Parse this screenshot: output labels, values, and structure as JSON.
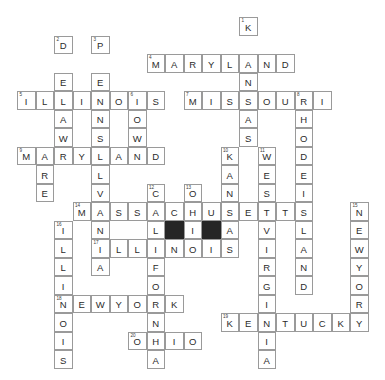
{
  "puzzle": {
    "kind": "crossword-grid",
    "columns": 21,
    "rows": 20,
    "cell_size": 18.5,
    "origin_x": 17,
    "origin_y": 17,
    "grid_color": "#9a9a9a",
    "block_color": "#262626",
    "letter_color": "#2b2b2b",
    "background": "#ffffff",
    "entries": [
      {
        "number": "1",
        "direction": "down",
        "answer": "KANSAS",
        "row": 0,
        "col": 12
      },
      {
        "number": "2",
        "direction": "down",
        "answer": "DELAWARE",
        "row": 1,
        "col": 2
      },
      {
        "number": "3",
        "direction": "down",
        "answer": "PENNSYLVANIA",
        "row": 1,
        "col": 4
      },
      {
        "number": "4",
        "direction": "across",
        "answer": "MARYLAND",
        "row": 2,
        "col": 7
      },
      {
        "number": "5",
        "direction": "across",
        "answer": "ILLINOIS",
        "row": 4,
        "col": 0
      },
      {
        "number": "6",
        "direction": "down",
        "answer": "IOWA",
        "row": 4,
        "col": 6
      },
      {
        "number": "7",
        "direction": "across",
        "answer": "MISSOURI",
        "row": 4,
        "col": 9
      },
      {
        "number": "8",
        "direction": "down",
        "answer": "RHODEISLAND",
        "row": 4,
        "col": 15
      },
      {
        "number": "9",
        "direction": "across",
        "answer": "MARYLAND",
        "row": 7,
        "col": 0
      },
      {
        "number": "10",
        "direction": "down",
        "answer": "KANSAS",
        "row": 7,
        "col": 11
      },
      {
        "number": "11",
        "direction": "down",
        "answer": "WESTVIRGINIA",
        "row": 7,
        "col": 13
      },
      {
        "number": "12",
        "direction": "down",
        "answer": "CALIFORNIA",
        "row": 9,
        "col": 7
      },
      {
        "number": "13",
        "direction": "down",
        "answer": "OHIO",
        "row": 9,
        "col": 9
      },
      {
        "number": "14",
        "direction": "across",
        "answer": "MASSACHUSETTS",
        "row": 10,
        "col": 3
      },
      {
        "number": "15",
        "direction": "down",
        "answer": "NEWYORK",
        "row": 10,
        "col": 18
      },
      {
        "number": "16",
        "direction": "down",
        "answer": "ILLINOIS",
        "row": 11,
        "col": 2
      },
      {
        "number": "17",
        "direction": "across",
        "answer": "ILLINOIS",
        "row": 12,
        "col": 4
      },
      {
        "number": "18",
        "direction": "across",
        "answer": "NEWYORK",
        "row": 15,
        "col": 2
      },
      {
        "number": "19",
        "direction": "across",
        "answer": "KENTUCKY",
        "row": 16,
        "col": 11
      },
      {
        "number": "20",
        "direction": "across",
        "answer": "OHIO",
        "row": 17,
        "col": 6
      }
    ],
    "extra_cells": [
      {
        "row": 2,
        "col": 3,
        "letter": ""
      },
      {
        "row": 11,
        "col": 7,
        "letter": "",
        "block": true
      },
      {
        "row": 11,
        "col": 9,
        "letter": "",
        "block": true
      }
    ],
    "letters": [
      {
        "row": 0,
        "col": 12,
        "letter": "K",
        "number": "1"
      },
      {
        "row": 1,
        "col": 2,
        "letter": "D",
        "number": "2"
      },
      {
        "row": 1,
        "col": 4,
        "letter": "P",
        "number": "3"
      },
      {
        "row": 2,
        "col": 7,
        "letter": "M",
        "number": "4"
      },
      {
        "row": 2,
        "col": 8,
        "letter": "A"
      },
      {
        "row": 2,
        "col": 9,
        "letter": "R"
      },
      {
        "row": 2,
        "col": 10,
        "letter": "Y"
      },
      {
        "row": 2,
        "col": 11,
        "letter": "L"
      },
      {
        "row": 2,
        "col": 12,
        "letter": "A"
      },
      {
        "row": 2,
        "col": 13,
        "letter": "N"
      },
      {
        "row": 2,
        "col": 14,
        "letter": "D"
      },
      {
        "row": 3,
        "col": 2,
        "letter": "E"
      },
      {
        "row": 3,
        "col": 4,
        "letter": "E"
      },
      {
        "row": 3,
        "col": 12,
        "letter": "N"
      },
      {
        "row": 4,
        "col": 0,
        "letter": "I",
        "number": "5"
      },
      {
        "row": 4,
        "col": 1,
        "letter": "L"
      },
      {
        "row": 4,
        "col": 2,
        "letter": "L"
      },
      {
        "row": 4,
        "col": 3,
        "letter": "I"
      },
      {
        "row": 4,
        "col": 4,
        "letter": "N"
      },
      {
        "row": 4,
        "col": 5,
        "letter": "O"
      },
      {
        "row": 4,
        "col": 6,
        "letter": "I",
        "number": "6"
      },
      {
        "row": 4,
        "col": 7,
        "letter": "S"
      },
      {
        "row": 4,
        "col": 9,
        "letter": "M",
        "number": "7"
      },
      {
        "row": 4,
        "col": 10,
        "letter": "I"
      },
      {
        "row": 4,
        "col": 11,
        "letter": "S"
      },
      {
        "row": 4,
        "col": 12,
        "letter": "S"
      },
      {
        "row": 4,
        "col": 13,
        "letter": "O"
      },
      {
        "row": 4,
        "col": 14,
        "letter": "U"
      },
      {
        "row": 4,
        "col": 15,
        "letter": "R",
        "number": "8"
      },
      {
        "row": 4,
        "col": 16,
        "letter": "I"
      },
      {
        "row": 5,
        "col": 2,
        "letter": "A"
      },
      {
        "row": 5,
        "col": 4,
        "letter": "N"
      },
      {
        "row": 5,
        "col": 6,
        "letter": "O"
      },
      {
        "row": 5,
        "col": 12,
        "letter": "A"
      },
      {
        "row": 5,
        "col": 15,
        "letter": "H"
      },
      {
        "row": 6,
        "col": 2,
        "letter": "W"
      },
      {
        "row": 6,
        "col": 4,
        "letter": "S"
      },
      {
        "row": 6,
        "col": 6,
        "letter": "W"
      },
      {
        "row": 6,
        "col": 12,
        "letter": "S"
      },
      {
        "row": 6,
        "col": 15,
        "letter": "O"
      },
      {
        "row": 7,
        "col": 0,
        "letter": "M",
        "number": "9"
      },
      {
        "row": 7,
        "col": 1,
        "letter": "A"
      },
      {
        "row": 7,
        "col": 2,
        "letter": "R"
      },
      {
        "row": 7,
        "col": 3,
        "letter": "Y"
      },
      {
        "row": 7,
        "col": 4,
        "letter": "L"
      },
      {
        "row": 7,
        "col": 5,
        "letter": "A"
      },
      {
        "row": 7,
        "col": 6,
        "letter": "N"
      },
      {
        "row": 7,
        "col": 7,
        "letter": "D"
      },
      {
        "row": 7,
        "col": 11,
        "letter": "K",
        "number": "10"
      },
      {
        "row": 7,
        "col": 13,
        "letter": "W",
        "number": "11"
      },
      {
        "row": 7,
        "col": 15,
        "letter": "D"
      },
      {
        "row": 8,
        "col": 1,
        "letter": "R"
      },
      {
        "row": 8,
        "col": 4,
        "letter": "L"
      },
      {
        "row": 8,
        "col": 11,
        "letter": "A"
      },
      {
        "row": 8,
        "col": 13,
        "letter": "E"
      },
      {
        "row": 8,
        "col": 15,
        "letter": "E"
      },
      {
        "row": 9,
        "col": 1,
        "letter": "E"
      },
      {
        "row": 9,
        "col": 4,
        "letter": "V"
      },
      {
        "row": 9,
        "col": 7,
        "letter": "C",
        "number": "12"
      },
      {
        "row": 9,
        "col": 9,
        "letter": "O",
        "number": "13"
      },
      {
        "row": 9,
        "col": 11,
        "letter": "N"
      },
      {
        "row": 9,
        "col": 13,
        "letter": "S"
      },
      {
        "row": 9,
        "col": 15,
        "letter": "I"
      },
      {
        "row": 10,
        "col": 3,
        "letter": "M",
        "number": "14"
      },
      {
        "row": 10,
        "col": 4,
        "letter": "A"
      },
      {
        "row": 10,
        "col": 5,
        "letter": "S"
      },
      {
        "row": 10,
        "col": 6,
        "letter": "S"
      },
      {
        "row": 10,
        "col": 7,
        "letter": "A"
      },
      {
        "row": 10,
        "col": 8,
        "letter": "C"
      },
      {
        "row": 10,
        "col": 9,
        "letter": "H"
      },
      {
        "row": 10,
        "col": 10,
        "letter": "U"
      },
      {
        "row": 10,
        "col": 11,
        "letter": "S"
      },
      {
        "row": 10,
        "col": 12,
        "letter": "E"
      },
      {
        "row": 10,
        "col": 13,
        "letter": "T"
      },
      {
        "row": 10,
        "col": 14,
        "letter": "T"
      },
      {
        "row": 10,
        "col": 15,
        "letter": "S"
      },
      {
        "row": 10,
        "col": 18,
        "letter": "N",
        "number": "15"
      },
      {
        "row": 11,
        "col": 2,
        "letter": "I",
        "number": "16"
      },
      {
        "row": 11,
        "col": 4,
        "letter": "N"
      },
      {
        "row": 11,
        "col": 7,
        "letter": "L"
      },
      {
        "row": 11,
        "col": 9,
        "letter": "I"
      },
      {
        "row": 11,
        "col": 11,
        "letter": "A"
      },
      {
        "row": 11,
        "col": 13,
        "letter": "V"
      },
      {
        "row": 11,
        "col": 15,
        "letter": "L"
      },
      {
        "row": 11,
        "col": 18,
        "letter": "E"
      },
      {
        "row": 12,
        "col": 2,
        "letter": "L"
      },
      {
        "row": 12,
        "col": 4,
        "letter": "I",
        "number": "17"
      },
      {
        "row": 12,
        "col": 5,
        "letter": "L"
      },
      {
        "row": 12,
        "col": 6,
        "letter": "L"
      },
      {
        "row": 12,
        "col": 7,
        "letter": "I"
      },
      {
        "row": 12,
        "col": 8,
        "letter": "N"
      },
      {
        "row": 12,
        "col": 9,
        "letter": "O"
      },
      {
        "row": 12,
        "col": 10,
        "letter": "I"
      },
      {
        "row": 12,
        "col": 11,
        "letter": "S"
      },
      {
        "row": 12,
        "col": 13,
        "letter": "I"
      },
      {
        "row": 12,
        "col": 15,
        "letter": "A"
      },
      {
        "row": 12,
        "col": 18,
        "letter": "W"
      },
      {
        "row": 13,
        "col": 2,
        "letter": "L"
      },
      {
        "row": 13,
        "col": 4,
        "letter": "A"
      },
      {
        "row": 13,
        "col": 7,
        "letter": "F"
      },
      {
        "row": 13,
        "col": 13,
        "letter": "R"
      },
      {
        "row": 13,
        "col": 15,
        "letter": "N"
      },
      {
        "row": 13,
        "col": 18,
        "letter": "Y"
      },
      {
        "row": 14,
        "col": 2,
        "letter": "I"
      },
      {
        "row": 14,
        "col": 7,
        "letter": "O"
      },
      {
        "row": 14,
        "col": 13,
        "letter": "G"
      },
      {
        "row": 14,
        "col": 15,
        "letter": "D"
      },
      {
        "row": 14,
        "col": 18,
        "letter": "O"
      },
      {
        "row": 15,
        "col": 2,
        "letter": "N",
        "number": "18"
      },
      {
        "row": 15,
        "col": 3,
        "letter": "E"
      },
      {
        "row": 15,
        "col": 4,
        "letter": "W"
      },
      {
        "row": 15,
        "col": 5,
        "letter": "Y"
      },
      {
        "row": 15,
        "col": 6,
        "letter": "O"
      },
      {
        "row": 15,
        "col": 7,
        "letter": "R"
      },
      {
        "row": 15,
        "col": 8,
        "letter": "K"
      },
      {
        "row": 15,
        "col": 13,
        "letter": "I"
      },
      {
        "row": 15,
        "col": 18,
        "letter": "R"
      },
      {
        "row": 16,
        "col": 2,
        "letter": "O"
      },
      {
        "row": 16,
        "col": 7,
        "letter": "N"
      },
      {
        "row": 16,
        "col": 11,
        "letter": "K",
        "number": "19"
      },
      {
        "row": 16,
        "col": 12,
        "letter": "E"
      },
      {
        "row": 16,
        "col": 13,
        "letter": "N"
      },
      {
        "row": 16,
        "col": 14,
        "letter": "T"
      },
      {
        "row": 16,
        "col": 15,
        "letter": "U"
      },
      {
        "row": 16,
        "col": 16,
        "letter": "C"
      },
      {
        "row": 16,
        "col": 17,
        "letter": "K"
      },
      {
        "row": 16,
        "col": 18,
        "letter": "Y"
      },
      {
        "row": 17,
        "col": 2,
        "letter": "I"
      },
      {
        "row": 17,
        "col": 6,
        "letter": "O",
        "number": "20"
      },
      {
        "row": 17,
        "col": 7,
        "letter": "H"
      },
      {
        "row": 17,
        "col": 8,
        "letter": "I"
      },
      {
        "row": 17,
        "col": 9,
        "letter": "O"
      },
      {
        "row": 17,
        "col": 13,
        "letter": "I"
      },
      {
        "row": 18,
        "col": 2,
        "letter": "S"
      },
      {
        "row": 18,
        "col": 7,
        "letter": "A"
      },
      {
        "row": 18,
        "col": 13,
        "letter": "A"
      }
    ],
    "blocks": [
      {
        "row": 11,
        "col": 8
      },
      {
        "row": 11,
        "col": 10
      }
    ]
  }
}
